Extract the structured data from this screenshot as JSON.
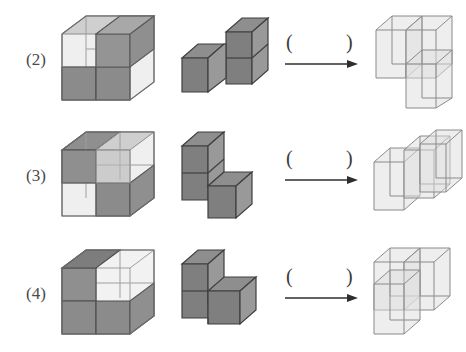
{
  "page": {
    "background_color": "#ffffff",
    "width": 466,
    "height": 352
  },
  "palette": {
    "solid_top": "#8e8e8e",
    "solid_left": "#7e7e7e",
    "solid_right": "#969696",
    "solid_top_dark": "#7a7a7a",
    "ghost_fill": "#d9d9d9",
    "ghost_fill_light": "#e6e6e6",
    "edge_dark": "#4a4a4a",
    "edge_light": "#9a9a9a",
    "text_color": "#4a4a4a",
    "arrow_color": "#2e2e2e"
  },
  "arrow": {
    "open_paren": "(",
    "close_paren": ")",
    "glyph": "→",
    "name": "right-arrow-with-blank"
  },
  "rows": [
    {
      "label": "(2)",
      "cells": {
        "target_cube": {
          "caption": "2x2x2 assembled cube, semi-transparent with shaded units",
          "units": 8
        },
        "given_piece": {
          "caption": "L-shaped tromino piece, solid gray",
          "units": 3,
          "cells": [
            [
              0,
              0,
              0
            ],
            [
              1,
              0,
              0
            ],
            [
              1,
              0,
              1
            ]
          ]
        },
        "answer_blank": {
          "caption": "blank answer parentheses with arrow"
        },
        "result_shape": {
          "caption": "wireframe complement piece",
          "units": 3,
          "cells": [
            [
              0,
              1,
              1
            ],
            [
              1,
              1,
              1
            ],
            [
              1,
              0,
              1
            ]
          ]
        }
      }
    },
    {
      "label": "(3)",
      "cells": {
        "target_cube": {
          "caption": "2x2x2 assembled cube, semi-transparent with shaded units",
          "units": 8
        },
        "given_piece": {
          "caption": "L-shaped piece, tall left column plus one right cube",
          "units": 3,
          "cells": [
            [
              0,
              0,
              0
            ],
            [
              0,
              0,
              1
            ],
            [
              1,
              0,
              0
            ]
          ]
        },
        "answer_blank": {
          "caption": "blank answer parentheses with arrow"
        },
        "result_shape": {
          "caption": "wireframe complement piece",
          "units": 3,
          "cells": [
            [
              0,
              1,
              0
            ],
            [
              1,
              1,
              0
            ],
            [
              1,
              1,
              1
            ]
          ]
        }
      }
    },
    {
      "label": "(4)",
      "cells": {
        "target_cube": {
          "caption": "2x2x2 assembled cube, semi-transparent with shaded units",
          "units": 8
        },
        "given_piece": {
          "caption": "Step shaped piece, two base cubes plus one on top left",
          "units": 3,
          "cells": [
            [
              0,
              0,
              0
            ],
            [
              1,
              0,
              0
            ],
            [
              0,
              0,
              1
            ]
          ]
        },
        "answer_blank": {
          "caption": "blank answer parentheses with arrow"
        },
        "result_shape": {
          "caption": "wireframe complement piece",
          "units": 3,
          "cells": [
            [
              0,
              1,
              0
            ],
            [
              0,
              1,
              1
            ],
            [
              1,
              1,
              1
            ]
          ]
        }
      }
    }
  ]
}
